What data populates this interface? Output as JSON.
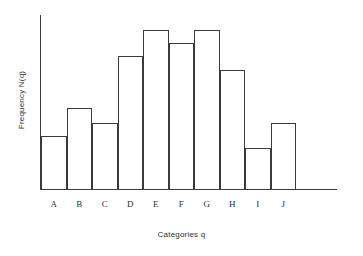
{
  "chart_data": {
    "type": "bar",
    "title": "",
    "subtitle": "",
    "xlabel": "Categories q",
    "ylabel": "Frequency N(q)",
    "categories": [
      "A",
      "B",
      "C",
      "D",
      "E",
      "F",
      "G",
      "H",
      "I",
      "J"
    ],
    "values": [
      53,
      81,
      66,
      133,
      159,
      146,
      159,
      119,
      41,
      66
    ],
    "ylim": [
      0,
      174
    ],
    "xlim": [
      0,
      10
    ],
    "grid": false,
    "legend": null,
    "legend_position": "none",
    "y_tick_labels": [],
    "x_tick_labels": [
      "A",
      "B",
      "C",
      "D",
      "E",
      "F",
      "G",
      "H",
      "I",
      "J"
    ],
    "annotations": [],
    "style": {
      "bar_fill": "#ffffff",
      "bar_stroke": "#3a3a3a",
      "axis_color": "#3a3a3a",
      "text_color": "#2e2e2e",
      "background": "#ffffff",
      "bar_gap": 0
    }
  }
}
